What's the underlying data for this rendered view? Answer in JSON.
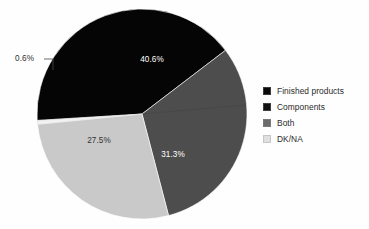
{
  "chart_data": {
    "type": "pie",
    "title": "",
    "subtitle": "",
    "xlabel": "",
    "ylabel": "",
    "grid": false,
    "legend_position": "right",
    "categories": [
      "Finished products",
      "Components",
      "Both",
      "DK/NA"
    ],
    "values": [
      40.6,
      31.3,
      27.5,
      0.6
    ],
    "value_labels": [
      "40.6%",
      "31.3%",
      "27.5%",
      "0.6%"
    ],
    "colors": [
      "#050505",
      "#4d4d4d",
      "#c9c9c9",
      "#f2f2f2"
    ],
    "label_text_colors": [
      "#ffffff",
      "#ffffff",
      "#333333",
      "#333333"
    ],
    "units": "percent",
    "annotations": [
      {
        "text": "0.6%",
        "for": "DK/NA",
        "placement": "outside-left-with-leader"
      }
    ],
    "slices": [
      {
        "label": "Finished products",
        "value": 40.6,
        "display": "40.6%",
        "color": "#050505",
        "start_angle": -93.5,
        "end_angle": 52.6,
        "label_inside": true
      },
      {
        "label": "Components",
        "value": 31.3,
        "display": "31.3%",
        "color": "#4d4d4d",
        "start_angle": 52.6,
        "end_angle": 165.3,
        "label_inside": true
      },
      {
        "label": "Both",
        "value": 27.5,
        "display": "27.5%",
        "color": "#c9c9c9",
        "start_angle": 165.3,
        "end_angle": 264.3,
        "label_inside": true
      },
      {
        "label": "DK/NA",
        "value": 0.6,
        "display": "0.6%",
        "color": "#f2f2f2",
        "start_angle": 264.3,
        "end_angle": 266.5,
        "label_inside": false
      }
    ]
  },
  "legend": {
    "items": [
      {
        "label": "Finished products",
        "color": "#0a0a0a"
      },
      {
        "label": "Components",
        "color": "#111111"
      },
      {
        "label": "Both",
        "color": "#6b6b6b"
      },
      {
        "label": "DK/NA",
        "color": "#e0e0e0"
      }
    ]
  },
  "labels": {
    "slice_top": "40.6%",
    "slice_right": "31.3%",
    "slice_left": "27.5%",
    "slice_callout": "0.6%"
  }
}
